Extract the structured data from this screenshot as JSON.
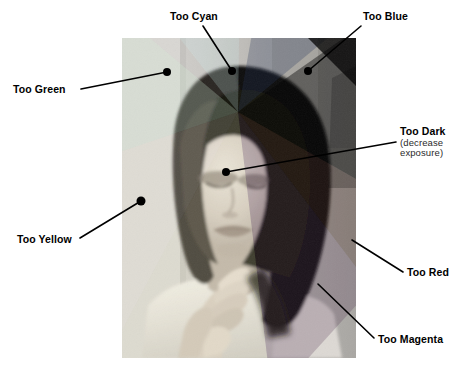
{
  "figure": {
    "background_color": "#ffffff",
    "text_color": "#000000",
    "photo": {
      "name": "portrait-photograph",
      "description": "Black and white portrait of a woman with dark hair resting her chin on her hands",
      "x": 122,
      "y": 38,
      "width": 234,
      "height": 320
    },
    "annotations": [
      {
        "id": "too-cyan",
        "label": "Too Cyan",
        "sub": "",
        "label_x": 170,
        "label_y": 11,
        "dot_x": 232,
        "dot_y": 71,
        "line_from_x": 203,
        "line_from_y": 26,
        "has_dot": true
      },
      {
        "id": "too-blue",
        "label": "Too Blue",
        "sub": "",
        "label_x": 363,
        "label_y": 11,
        "dot_x": 308,
        "dot_y": 71,
        "line_from_x": 361,
        "line_from_y": 26,
        "has_dot": true
      },
      {
        "id": "too-green",
        "label": "Too Green",
        "sub": "",
        "label_x": 13,
        "label_y": 84,
        "dot_x": 167,
        "dot_y": 72,
        "line_from_x": 81,
        "line_from_y": 89,
        "has_dot": true
      },
      {
        "id": "too-dark",
        "label": "Too Dark",
        "sub": "(decrease exposure)",
        "sub_line1": "(decrease",
        "sub_line2": "exposure)",
        "label_x": 400,
        "label_y": 126,
        "dot_x": 226,
        "dot_y": 172,
        "line_from_x": 396,
        "line_from_y": 142,
        "has_dot": true
      },
      {
        "id": "too-yellow",
        "label": "Too Yellow",
        "sub": "",
        "label_x": 17,
        "label_y": 234,
        "dot_x": 141,
        "dot_y": 201,
        "line_from_x": 80,
        "line_from_y": 238,
        "has_dot": true
      },
      {
        "id": "too-red",
        "label": "Too Red",
        "sub": "",
        "label_x": 407,
        "label_y": 267,
        "dot_x": 352,
        "dot_y": 240,
        "line_from_x": 403,
        "line_from_y": 272,
        "has_dot": false
      },
      {
        "id": "too-magenta",
        "label": "Too Magenta",
        "sub": "",
        "label_x": 378,
        "label_y": 334,
        "dot_x": 318,
        "dot_y": 284,
        "line_from_x": 374,
        "line_from_y": 338,
        "has_dot": false
      }
    ]
  }
}
